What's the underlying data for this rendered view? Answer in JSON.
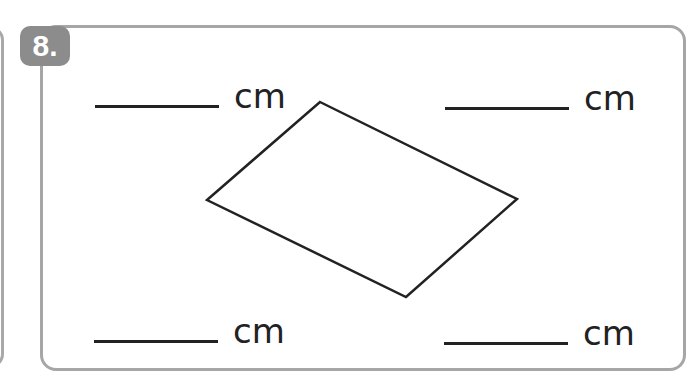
{
  "question": {
    "number": "8.",
    "badge_color": "#8c8c8c",
    "border_color": "#a6a6a6"
  },
  "answers": [
    {
      "position": "top-left",
      "value": "",
      "unit": "cm"
    },
    {
      "position": "top-right",
      "value": "",
      "unit": "cm"
    },
    {
      "position": "bottom-left",
      "value": "",
      "unit": "cm"
    },
    {
      "position": "bottom-right",
      "value": "",
      "unit": "cm"
    }
  ],
  "shape": {
    "type": "parallelogram",
    "vertices": [
      [
        320,
        102
      ],
      [
        517,
        199
      ],
      [
        406,
        297
      ],
      [
        207,
        200
      ]
    ],
    "stroke": "#222222"
  }
}
